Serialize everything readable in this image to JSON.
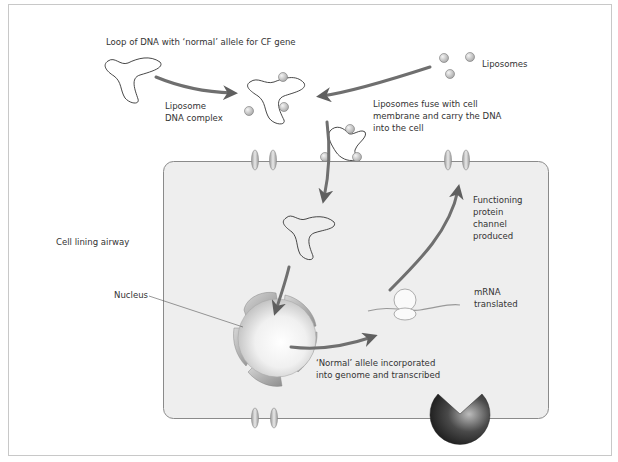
{
  "diagram": {
    "colors": {
      "frame_border": "#c8c8c8",
      "cell_fill": "#eeeeee",
      "cell_border": "#8a8a8a",
      "arrow": "#6f6f6f",
      "text": "#333333",
      "liposome": "#c0c0c0",
      "nucleus": "#dcdcdc",
      "receptor": "#2a2a2a"
    },
    "labels": {
      "dna_loop": "Loop of DNA with ‘normal’ allele for CF gene",
      "liposomes": "Liposomes",
      "liposome_dna_complex": "Liposome\nDNA complex",
      "fuse": "Liposomes fuse with cell\nmembrane and carry the DNA\ninto the cell",
      "functioning_channel": "Functioning\nprotein\nchannel\nproduced",
      "cell_lining": "Cell lining airway",
      "nucleus": "Nucleus",
      "mrna": "mRNA\ntranslated",
      "allele_incorporated": "‘Normal’ allele incorporated\ninto genome and transcribed"
    },
    "nodes": [
      {
        "id": "dna-loop",
        "label_ref": "dna_loop"
      },
      {
        "id": "liposomes",
        "label_ref": "liposomes"
      },
      {
        "id": "liposome-dna-complex",
        "label_ref": "liposome_dna_complex"
      },
      {
        "id": "membrane-fusion",
        "label_ref": "fuse"
      },
      {
        "id": "nucleus",
        "label_ref": "nucleus"
      },
      {
        "id": "ribosome-mrna",
        "label_ref": "mrna"
      },
      {
        "id": "protein-channel",
        "label_ref": "functioning_channel"
      }
    ],
    "edges": [
      {
        "from": "dna-loop",
        "to": "liposome-dna-complex"
      },
      {
        "from": "liposomes",
        "to": "liposome-dna-complex"
      },
      {
        "from": "liposome-dna-complex",
        "to": "cytoplasm-dna"
      },
      {
        "from": "cytoplasm-dna",
        "to": "nucleus"
      },
      {
        "from": "nucleus",
        "to": "ribosome-mrna"
      },
      {
        "from": "ribosome-mrna",
        "to": "protein-channel"
      }
    ]
  }
}
